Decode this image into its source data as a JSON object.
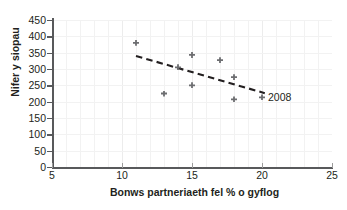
{
  "chart_data": {
    "type": "scatter",
    "title": "",
    "xlabel": "Bonws partneriaeth fel % o gyflog",
    "ylabel": "Nifer y siopau",
    "xlim": [
      5,
      25
    ],
    "ylim": [
      0,
      450
    ],
    "xticks": [
      5,
      10,
      15,
      20,
      25
    ],
    "yticks": [
      0,
      50,
      100,
      150,
      200,
      250,
      300,
      350,
      400,
      450
    ],
    "xtick_labels": [
      "5",
      "10",
      "15",
      "20",
      "25"
    ],
    "ytick_labels": [
      "0",
      "50",
      "100",
      "150",
      "200",
      "250",
      "300",
      "350",
      "400",
      "450"
    ],
    "grid": true,
    "legend": "none",
    "marker_color": "#6d6e71",
    "trendline_color": "#231f20",
    "axis_color": "#58595b",
    "grid_color": "#f2f2f2",
    "points": [
      {
        "x": 11,
        "y": 380,
        "label": ""
      },
      {
        "x": 13,
        "y": 225,
        "label": ""
      },
      {
        "x": 14,
        "y": 305,
        "label": ""
      },
      {
        "x": 15,
        "y": 343,
        "label": ""
      },
      {
        "x": 15,
        "y": 250,
        "label": ""
      },
      {
        "x": 17,
        "y": 327,
        "label": ""
      },
      {
        "x": 18,
        "y": 275,
        "label": ""
      },
      {
        "x": 18,
        "y": 207,
        "label": ""
      },
      {
        "x": 20,
        "y": 213,
        "label": "2008"
      }
    ],
    "annotations": [
      {
        "text": "2008",
        "x": 20,
        "y": 213
      }
    ],
    "trendline": {
      "type": "linear-dashed",
      "x_start": 11,
      "y_start": 340,
      "x_end": 20.2,
      "y_end": 226
    }
  }
}
